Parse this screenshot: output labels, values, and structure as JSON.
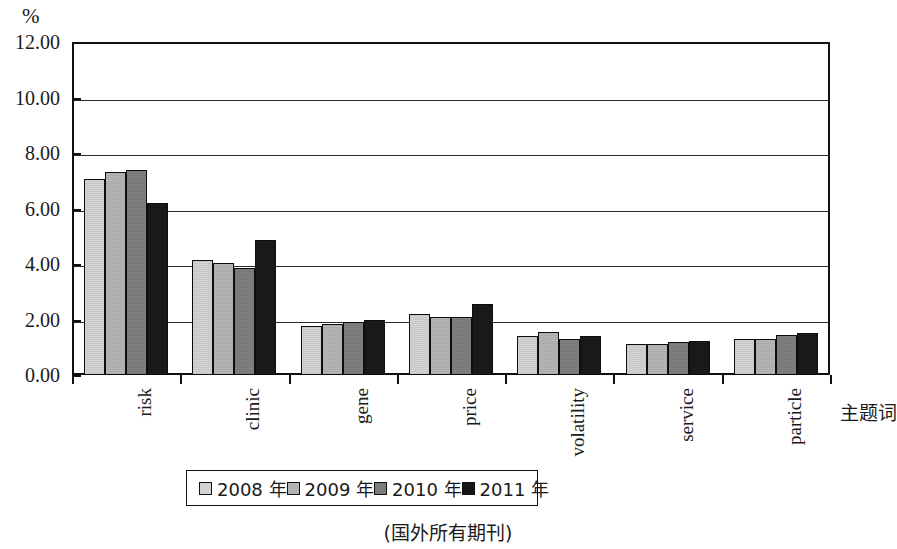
{
  "chart_data": {
    "type": "bar",
    "title": "",
    "xlabel": "主题词",
    "ylabel": "%",
    "ylim": [
      0,
      12
    ],
    "ytick_labels": [
      "12.00",
      "10.00",
      "8.00",
      "6.00",
      "4.00",
      "2.00",
      "0.00"
    ],
    "ytick_values": [
      12,
      10,
      8,
      6,
      4,
      2,
      0
    ],
    "grid": true,
    "legend_position": "bottom",
    "categories": [
      "risk",
      "clinic",
      "gene",
      "price",
      "volatility",
      "service",
      "particle"
    ],
    "series": [
      {
        "name": "2008 年",
        "color": "#d2d2d2",
        "values": [
          7.05,
          4.15,
          1.75,
          2.2,
          1.4,
          1.1,
          1.3
        ]
      },
      {
        "name": "2009 年",
        "color": "#b4b4b4",
        "values": [
          7.3,
          4.05,
          1.85,
          2.1,
          1.55,
          1.1,
          1.3
        ]
      },
      {
        "name": "2010 年",
        "color": "#7d7d7d",
        "values": [
          7.4,
          3.85,
          1.9,
          2.1,
          1.3,
          1.2,
          1.45
        ]
      },
      {
        "name": "2011 年",
        "color": "#161616",
        "values": [
          6.2,
          4.85,
          2.0,
          2.55,
          1.4,
          1.22,
          1.5
        ]
      }
    ],
    "caption": "(国外所有期刊)"
  }
}
